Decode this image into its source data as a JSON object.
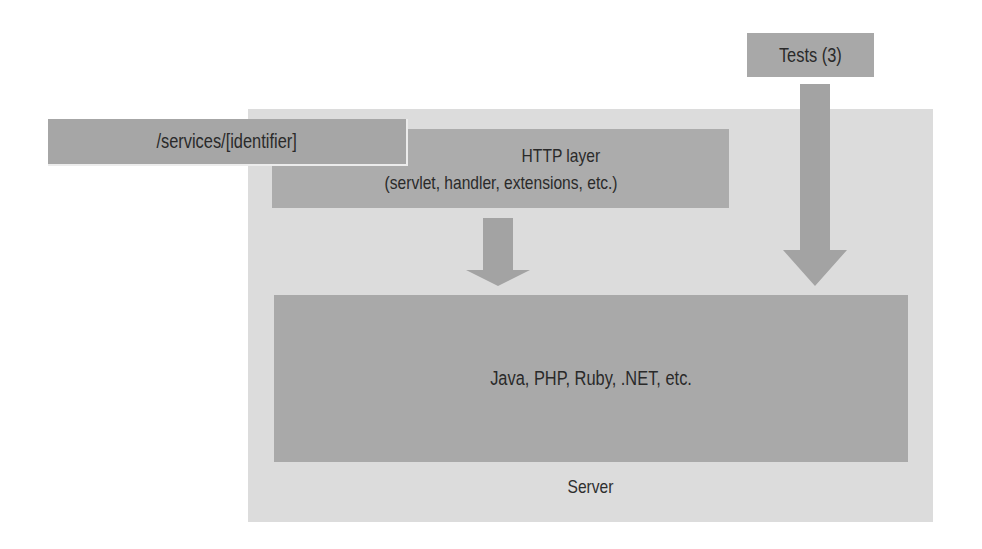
{
  "diagram": {
    "server": {
      "label": "Server",
      "fill": "#dcdcdc"
    },
    "language_layer": {
      "label": "Java, PHP, Ruby, .NET, etc.",
      "fill": "#a9a9a9"
    },
    "http_layer": {
      "title": "HTTP layer",
      "subtitle": "(servlet, handler, extensions, etc.)",
      "fill": "#acacac"
    },
    "service_path": {
      "label": "/services/[identifier]",
      "fill": "#a6a6a6"
    },
    "tests": {
      "label": "Tests (3)",
      "fill": "#a8a8a8"
    },
    "arrows": [
      {
        "from": "http_layer",
        "to": "language_layer",
        "color": "#a3a3a3"
      },
      {
        "from": "tests",
        "to": "language_layer",
        "color": "#a3a3a3"
      }
    ]
  }
}
